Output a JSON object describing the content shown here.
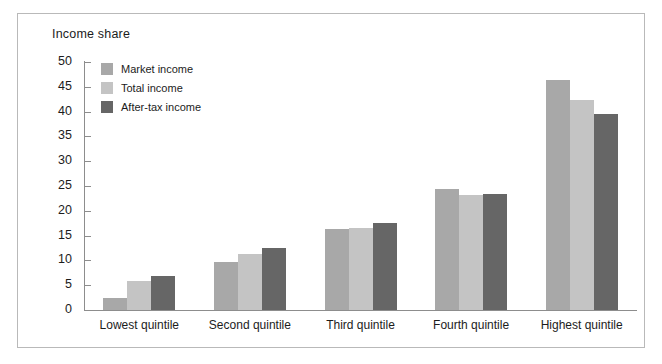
{
  "figure": {
    "axis_title": "Income share",
    "border_color": "#b9b9b9",
    "background": "#ffffff"
  },
  "legend": {
    "position": "top-left-inside",
    "items": [
      {
        "label": "Market income",
        "color": "#a8a8a8"
      },
      {
        "label": "Total income",
        "color": "#c4c4c4"
      },
      {
        "label": "After-tax income",
        "color": "#666666"
      }
    ]
  },
  "axes": {
    "y_ticks": [
      "0",
      "5",
      "10",
      "15",
      "20",
      "25",
      "30",
      "35",
      "40",
      "45",
      "50"
    ],
    "y_min": 0,
    "y_max": 50,
    "y_step": 5,
    "x_categories": [
      "Lowest quintile",
      "Second quintile",
      "Third quintile",
      "Fourth quintile",
      "Highest quintile"
    ],
    "axis_color": "#8d8d8d"
  },
  "chart_data": {
    "type": "bar",
    "title": "Income share",
    "xlabel": "",
    "ylabel": "Income share",
    "ylim": [
      0,
      50
    ],
    "ytick_step": 5,
    "grid": false,
    "legend_position": "upper left",
    "categories": [
      "Lowest quintile",
      "Second quintile",
      "Third quintile",
      "Fourth quintile",
      "Highest quintile"
    ],
    "series": [
      {
        "name": "Market income",
        "color": "#a8a8a8",
        "values": [
          2.5,
          9.7,
          16.4,
          24.3,
          46.4
        ]
      },
      {
        "name": "Total income",
        "color": "#c4c4c4",
        "values": [
          5.9,
          11.2,
          16.5,
          23.1,
          42.3
        ]
      },
      {
        "name": "After-tax income",
        "color": "#666666",
        "values": [
          6.8,
          12.5,
          17.5,
          23.3,
          39.5
        ]
      }
    ]
  }
}
